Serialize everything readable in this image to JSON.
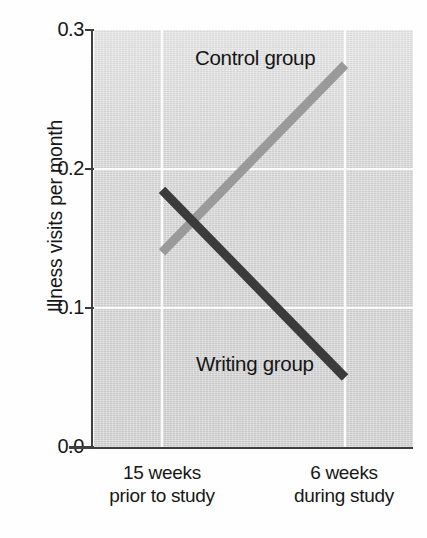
{
  "chart_data": {
    "type": "line",
    "title": "",
    "xlabel": "",
    "ylabel": "Illness visits per month",
    "categories": [
      "15 weeks prior to study",
      "6 weeks during study"
    ],
    "category_lines": [
      [
        "15 weeks",
        "prior to study"
      ],
      [
        "6 weeks",
        "during study"
      ]
    ],
    "ylim": [
      0.0,
      0.3
    ],
    "yticks": [
      "0.0",
      "0.1",
      "0.2",
      "0.3"
    ],
    "ytick_values": [
      0.0,
      0.1,
      0.2,
      0.3
    ],
    "grid": "white gridlines at y=0.1 and y=0.2, vertical at each category",
    "legend_position": "inline annotations on plot",
    "series": [
      {
        "name": "Control group",
        "color": "#9a9a9a",
        "values": [
          0.14,
          0.275
        ]
      },
      {
        "name": "Writing group",
        "color": "#3b3b3b",
        "values": [
          0.185,
          0.05
        ]
      }
    ],
    "annotations": [
      {
        "text": "Control group",
        "series": "Control group"
      },
      {
        "text": "Writing group",
        "series": "Writing group"
      }
    ]
  },
  "axis": {
    "y_title": "Illness visits per month",
    "tick_0": "0.0",
    "tick_1": "0.1",
    "tick_2": "0.2",
    "tick_3": "0.3"
  },
  "xaxis": {
    "left_line1": "15 weeks",
    "left_line2": "prior to study",
    "right_line1": "6 weeks",
    "right_line2": "during study"
  },
  "labels": {
    "control": "Control group",
    "writing": "Writing group"
  },
  "colors": {
    "control_line": "#9a9a9a",
    "writing_line": "#3b3b3b",
    "panel": "#d8d8d8",
    "grid": "#fbfbfb",
    "axis": "#3f3f3f",
    "text": "#171717"
  }
}
